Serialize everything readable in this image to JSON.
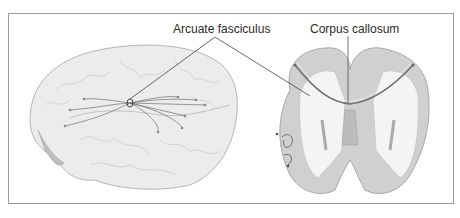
{
  "figure": {
    "labels": {
      "arcuate": "Arcuate fasciculus",
      "corpus": "Corpus callosum"
    },
    "views": [
      "lateral-hemisphere",
      "coronal-section"
    ],
    "colors": {
      "frame": "#9a9a9a",
      "brain_fill": "#ececec",
      "brain_outline": "#b5b5b5",
      "tract": "#6e6e6e",
      "gray_matter": "#c8c8c8",
      "leader_line": "#444444"
    }
  }
}
